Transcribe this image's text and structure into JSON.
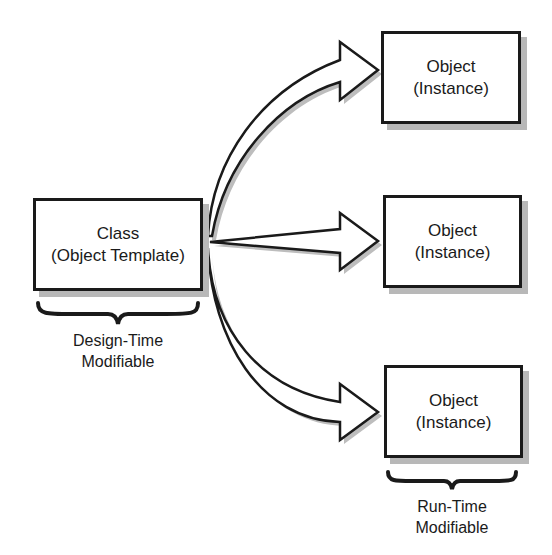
{
  "diagram": {
    "class_box": {
      "line1": "Class",
      "line2": "(Object Template)"
    },
    "class_caption": {
      "line1": "Design-Time",
      "line2": "Modifiable"
    },
    "object_boxes": [
      {
        "line1": "Object",
        "line2": "(Instance)"
      },
      {
        "line1": "Object",
        "line2": "(Instance)"
      },
      {
        "line1": "Object",
        "line2": "(Instance)"
      }
    ],
    "object_caption": {
      "line1": "Run-Time",
      "line2": "Modifiable"
    },
    "colors": {
      "stroke": "#1a1a1a",
      "shadow": "#b8b8b8",
      "fill": "#ffffff"
    }
  }
}
